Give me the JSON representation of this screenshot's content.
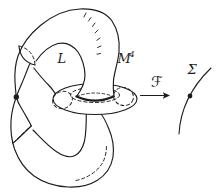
{
  "figure": {
    "labels": {
      "loop": "L",
      "manifold": "M",
      "manifold_exponent": "4",
      "map": "ℱ",
      "base_surface": "Σ"
    },
    "colors": {
      "ink": "#1c1c1c",
      "background": "#ffffff"
    }
  }
}
